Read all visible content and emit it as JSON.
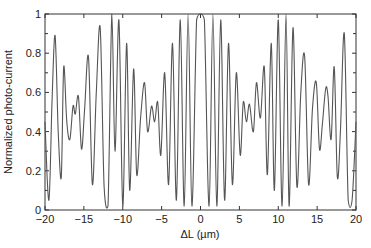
{
  "chart_data": {
    "type": "line",
    "title": "",
    "xlabel": "ΔL (µm)",
    "ylabel": "Normalized photo-current",
    "xlim": [
      -20,
      20
    ],
    "ylim": [
      0,
      1
    ],
    "xticks": [
      -20,
      -15,
      -10,
      -5,
      0,
      5,
      10,
      15,
      20
    ],
    "xtick_labels": [
      "−20",
      "−15",
      "−10",
      "−5",
      "0",
      "5",
      "10",
      "15",
      "20"
    ],
    "yticks": [
      0,
      0.2,
      0.4,
      0.6,
      0.8,
      1
    ],
    "ytick_labels": [
      "0",
      "0.2",
      "0.4",
      "0.6",
      "0.8",
      "1"
    ],
    "grid": false,
    "legend": null,
    "line_color": "#555555",
    "series": [
      {
        "name": "Normalized photo-current",
        "x": [
          -20,
          -19.5,
          -19.1,
          -18.7,
          -18.3,
          -17.9,
          -17.6,
          -17.2,
          -16.8,
          -16.4,
          -16.1,
          -15.7,
          -15.3,
          -14.9,
          -14.4,
          -13.9,
          -13.4,
          -12.9,
          -12.4,
          -11.9,
          -11.4,
          -11.0,
          -10.5,
          -10.0,
          -9.5,
          -9.1,
          -8.6,
          -8.2,
          -7.7,
          -7.2,
          -6.8,
          -6.3,
          -5.9,
          -5.5,
          -5.1,
          -4.6,
          -4.1,
          -3.6,
          -3.1,
          -2.6,
          -2.1,
          -1.6,
          -1.1,
          -0.5,
          0,
          0.5,
          1.1,
          1.6,
          2.1,
          2.6,
          3.1,
          3.6,
          4.1,
          4.6,
          5.1,
          5.5,
          5.9,
          6.3,
          6.8,
          7.2,
          7.7,
          8.2,
          8.6,
          9.1,
          9.5,
          10.0,
          10.5,
          11.0,
          11.4,
          11.9,
          12.4,
          12.9,
          13.4,
          13.9,
          14.4,
          14.9,
          15.3,
          15.7,
          16.1,
          16.4,
          16.8,
          17.2,
          17.6,
          18.0,
          18.5,
          19.0,
          19.5,
          20
        ],
        "y": [
          0.45,
          0.05,
          0.55,
          0.89,
          0.4,
          0.17,
          0.73,
          0.45,
          0.36,
          0.53,
          0.49,
          0.58,
          0.31,
          0.52,
          0.78,
          0.13,
          0.6,
          0.93,
          0.12,
          0.02,
          1.0,
          0.3,
          0.97,
          0.02,
          0.85,
          0.1,
          0.72,
          0.18,
          0.47,
          0.65,
          0.4,
          0.53,
          0.45,
          0.55,
          0.28,
          0.7,
          0.13,
          0.85,
          0.05,
          0.97,
          0.02,
          1.0,
          0.02,
          0.97,
          1.0,
          0.97,
          0.02,
          1.0,
          0.02,
          0.97,
          0.05,
          0.85,
          0.13,
          0.7,
          0.28,
          0.55,
          0.45,
          0.54,
          0.4,
          0.65,
          0.47,
          0.73,
          0.18,
          0.85,
          0.1,
          0.97,
          0.02,
          1.0,
          0.02,
          0.93,
          0.12,
          0.6,
          0.78,
          0.13,
          0.52,
          0.65,
          0.31,
          0.45,
          0.62,
          0.58,
          0.36,
          0.73,
          0.17,
          0.4,
          0.9,
          0.05,
          0.05,
          0.45
        ]
      }
    ]
  }
}
